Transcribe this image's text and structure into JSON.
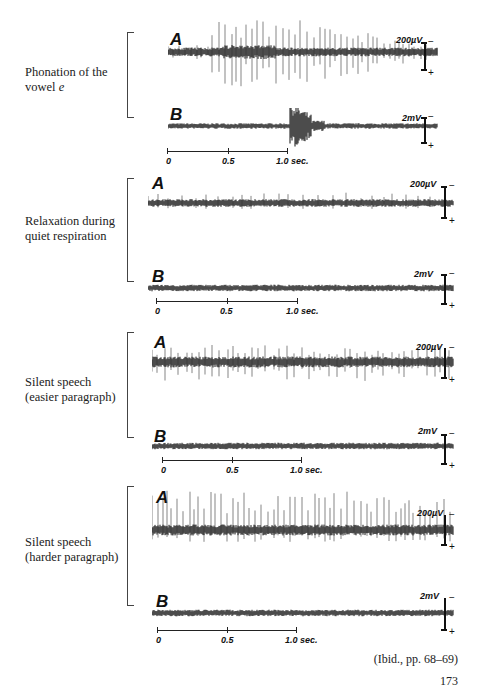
{
  "figure": {
    "panels": [
      {
        "caption_line1": "Phonation of the",
        "caption_line2": "vowel ",
        "caption_italic": "e",
        "trace_a_label": "A",
        "trace_a_cal": "200µV",
        "trace_b_label": "B",
        "trace_b_cal": "2mV",
        "scale_ticks": [
          "0",
          "0.5",
          "1.0 sec."
        ]
      },
      {
        "caption_line1": "Relaxation during",
        "caption_line2": "quiet respiration",
        "caption_italic": "",
        "trace_a_label": "A",
        "trace_a_cal": "200µV",
        "trace_b_label": "B",
        "trace_b_cal": "2mV",
        "scale_ticks": [
          "0",
          "0.5",
          "1.0 sec."
        ]
      },
      {
        "caption_line1": "Silent speech",
        "caption_line2": "(easier paragraph)",
        "caption_italic": "",
        "trace_a_label": "A",
        "trace_a_cal": "200µV",
        "trace_b_label": "B",
        "trace_b_cal": "2mV",
        "scale_ticks": [
          "0",
          "0.5",
          "1.0 sec."
        ]
      },
      {
        "caption_line1": "Silent speech",
        "caption_line2": "(harder paragraph)",
        "caption_italic": "",
        "trace_a_label": "A",
        "trace_a_cal": "200µV",
        "trace_b_label": "B",
        "trace_b_cal": "2mV",
        "scale_ticks": [
          "0",
          "0.5",
          "1.0 sec."
        ]
      }
    ],
    "calibration_signs": {
      "minus": "−",
      "plus": "+"
    }
  },
  "citation": "(Ibid., pp. 68–69)",
  "page_number": "173"
}
